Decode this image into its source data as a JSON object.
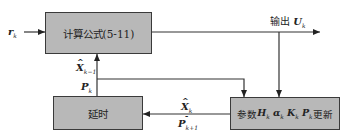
{
  "diagram": {
    "blocks": {
      "compute": {
        "label": "计算公式(5-11)"
      },
      "delay": {
        "label": "延时"
      },
      "update": {
        "prefix": "参数",
        "symbols": [
          "H",
          "α",
          "K",
          "P"
        ],
        "subscript": "k",
        "suffix": "更新"
      }
    },
    "signals": {
      "input": {
        "symbol": "r",
        "subscript": "k"
      },
      "output": {
        "prefix": "输出",
        "symbol": "U",
        "subscript": "k"
      },
      "feedback_x_prev": {
        "symbol": "X",
        "subscript": "k−1",
        "hat": true
      },
      "feedback_p": {
        "symbol": "P",
        "subscript": "k"
      },
      "loop_x": {
        "symbol": "X",
        "subscript": "k",
        "hat": true
      },
      "loop_p": {
        "symbol": "P",
        "subscript": "k+1",
        "superscript": "−"
      }
    },
    "colors": {
      "block_fill": "#b8b8b8",
      "line": "#333333"
    }
  }
}
